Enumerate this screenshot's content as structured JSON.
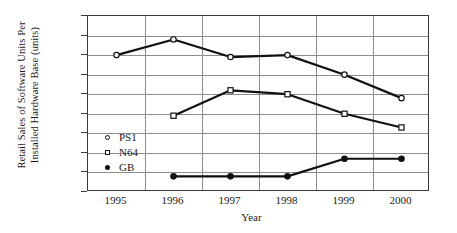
{
  "chart_data": {
    "type": "line",
    "title": "",
    "xlabel": "Year",
    "ylabel_line1": "Retail Sales of Software Units Per",
    "ylabel_line2": "Installed Hardware Base (units)",
    "categories": [
      "1995",
      "1996",
      "1997",
      "1998",
      "1999",
      "2000"
    ],
    "x": [
      1995,
      1996,
      1997,
      1998,
      1999,
      2000
    ],
    "ylim": [
      0.0,
      4.5
    ],
    "xlim": [
      1995,
      2000
    ],
    "yticks": [
      "0.0",
      "0.5",
      "1.0",
      "1.5",
      "2.0",
      "2.5",
      "3.0",
      "3.5",
      "4.0",
      "4.5"
    ],
    "ytick_values": [
      0.0,
      0.5,
      1.0,
      1.5,
      2.0,
      2.5,
      3.0,
      3.5,
      4.0,
      4.5
    ],
    "grid": "horizontal-and-vertical",
    "legend_position": "inside-lower-left",
    "series": [
      {
        "name": "PS1",
        "marker": "circle-open",
        "values": [
          3.5,
          3.9,
          3.45,
          3.5,
          3.0,
          2.4
        ]
      },
      {
        "name": "N64",
        "marker": "square-open",
        "values": [
          null,
          1.95,
          2.6,
          2.5,
          2.0,
          1.65
        ]
      },
      {
        "name": "GB",
        "marker": "circle-filled",
        "values": [
          null,
          0.4,
          0.4,
          0.4,
          0.85,
          0.85
        ]
      }
    ]
  },
  "legend": {
    "items": [
      {
        "label": "PS1",
        "marker": "circle-open"
      },
      {
        "label": "N64",
        "marker": "square-open"
      },
      {
        "label": "GB",
        "marker": "circle-filled"
      }
    ]
  },
  "colors": {
    "line": "#111111",
    "grid": "#8d8d8d",
    "frame": "#3a3a3a",
    "background": "#ffffff",
    "text": "#1a1a1a"
  }
}
